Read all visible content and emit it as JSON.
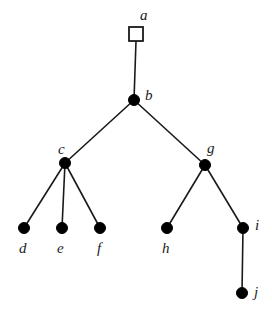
{
  "diagram": {
    "type": "tree-graph",
    "background_color": "#ffffff",
    "stroke_color": "#1a1a1a",
    "node_fill_color": "#000000",
    "root_fill_color": "#ffffff",
    "label_color": "#1a1a1a",
    "nodes": [
      {
        "id": "a",
        "label": "a",
        "shape": "square",
        "fill": "hollow",
        "x": 136,
        "y": 34,
        "size": 14,
        "label_x": 140,
        "label_y": 8,
        "label_anchor": "above"
      },
      {
        "id": "b",
        "label": "b",
        "shape": "circle",
        "fill": "solid",
        "x": 134,
        "y": 100,
        "size": 11,
        "label_x": 145,
        "label_y": 88,
        "label_anchor": "right"
      },
      {
        "id": "c",
        "label": "c",
        "shape": "circle",
        "fill": "solid",
        "x": 65,
        "y": 163,
        "size": 11,
        "label_x": 58,
        "label_y": 142,
        "label_anchor": "above-left"
      },
      {
        "id": "g",
        "label": "g",
        "shape": "circle",
        "fill": "solid",
        "x": 205,
        "y": 165,
        "size": 11,
        "label_x": 207,
        "label_y": 141,
        "label_anchor": "above-right"
      },
      {
        "id": "d",
        "label": "d",
        "shape": "circle",
        "fill": "solid",
        "x": 24,
        "y": 228,
        "size": 11,
        "label_x": 19,
        "label_y": 241,
        "label_anchor": "below"
      },
      {
        "id": "e",
        "label": "e",
        "shape": "circle",
        "fill": "solid",
        "x": 62,
        "y": 228,
        "size": 11,
        "label_x": 57,
        "label_y": 241,
        "label_anchor": "below"
      },
      {
        "id": "f",
        "label": "f",
        "shape": "circle",
        "fill": "solid",
        "x": 100,
        "y": 228,
        "size": 11,
        "label_x": 97,
        "label_y": 241,
        "label_anchor": "below"
      },
      {
        "id": "h",
        "label": "h",
        "shape": "circle",
        "fill": "solid",
        "x": 167,
        "y": 228,
        "size": 11,
        "label_x": 162,
        "label_y": 241,
        "label_anchor": "below"
      },
      {
        "id": "i",
        "label": "i",
        "shape": "circle",
        "fill": "solid",
        "x": 243,
        "y": 228,
        "size": 11,
        "label_x": 255,
        "label_y": 218,
        "label_anchor": "right"
      },
      {
        "id": "j",
        "label": "j",
        "shape": "circle",
        "fill": "solid",
        "x": 242,
        "y": 293,
        "size": 11,
        "label_x": 254,
        "label_y": 285,
        "label_anchor": "right"
      }
    ],
    "edges": [
      {
        "from": "a",
        "to": "b",
        "x1": 136,
        "y1": 41,
        "x2": 134,
        "y2": 100
      },
      {
        "from": "b",
        "to": "c",
        "x1": 134,
        "y1": 100,
        "x2": 65,
        "y2": 163
      },
      {
        "from": "b",
        "to": "g",
        "x1": 134,
        "y1": 100,
        "x2": 205,
        "y2": 165
      },
      {
        "from": "c",
        "to": "d",
        "x1": 65,
        "y1": 163,
        "x2": 24,
        "y2": 228
      },
      {
        "from": "c",
        "to": "e",
        "x1": 65,
        "y1": 163,
        "x2": 62,
        "y2": 228
      },
      {
        "from": "c",
        "to": "f",
        "x1": 65,
        "y1": 163,
        "x2": 100,
        "y2": 228
      },
      {
        "from": "g",
        "to": "h",
        "x1": 205,
        "y1": 165,
        "x2": 167,
        "y2": 228
      },
      {
        "from": "g",
        "to": "i",
        "x1": 205,
        "y1": 165,
        "x2": 243,
        "y2": 228
      },
      {
        "from": "i",
        "to": "j",
        "x1": 243,
        "y1": 228,
        "x2": 242,
        "y2": 293
      }
    ]
  }
}
